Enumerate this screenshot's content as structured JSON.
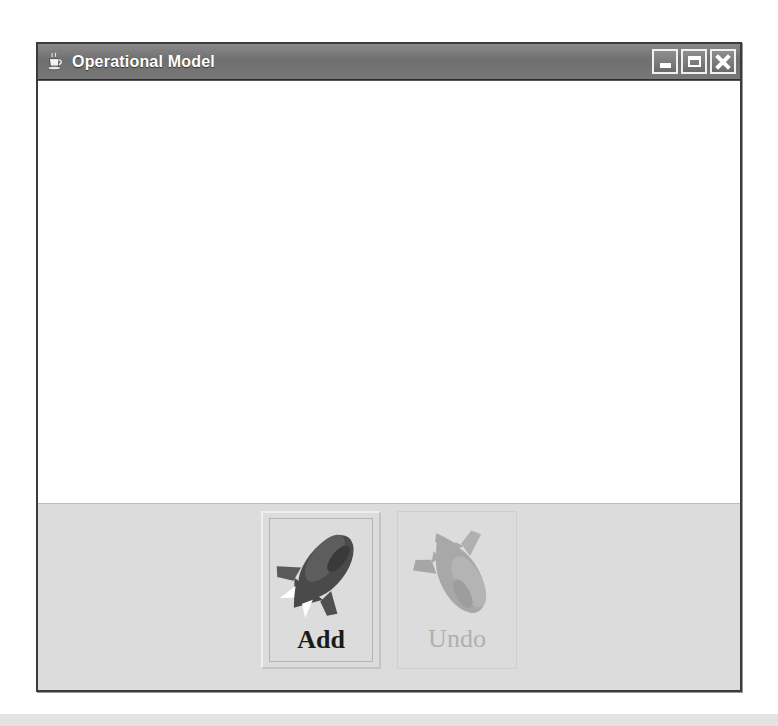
{
  "window": {
    "title": "Operational Model",
    "icon": "java-coffee-cup-icon",
    "controls": [
      {
        "name": "minimize-button",
        "label": "Minimize",
        "glyph": "dash"
      },
      {
        "name": "maximize-button",
        "label": "Maximize",
        "glyph": "square"
      },
      {
        "name": "close-button",
        "label": "Close",
        "glyph": "x"
      }
    ]
  },
  "canvas": {
    "content": "",
    "background": "#ffffff"
  },
  "toolbar": {
    "buttons": [
      {
        "label": "Add",
        "icon": "rocket-up-icon",
        "enabled": true,
        "focused": true
      },
      {
        "label": "Undo",
        "icon": "rocket-down-icon",
        "enabled": false,
        "focused": false
      }
    ]
  },
  "colors": {
    "titlebar": "#787878",
    "panel": "#dcdcdc",
    "canvas": "#ffffff",
    "border": "#3b3b3b",
    "label_enabled": "#1a1a1a",
    "label_disabled": "#b0b0b0"
  }
}
